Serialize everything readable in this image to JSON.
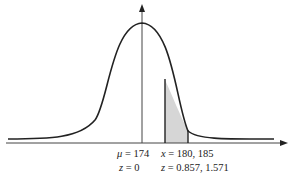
{
  "diagram": {
    "type": "normal-distribution-curve",
    "shaded_region": {
      "from_x": 180,
      "to_x": 185
    },
    "colors": {
      "curve": "#222222",
      "axis": "#444444",
      "shade": "#d6d6d6"
    },
    "labels": {
      "mean_var": "μ",
      "mean_eq": " = 174",
      "x_var": "x",
      "x_eq": " = 180, 185",
      "z0_var": "z",
      "z0_eq": " = 0",
      "z_var": "z",
      "z_eq": " = 0.857, 1.571"
    }
  }
}
